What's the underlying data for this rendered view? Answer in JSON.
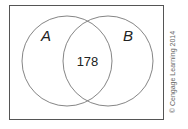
{
  "diagram": {
    "type": "venn",
    "universe_border_color": "#555555",
    "circle_color": "#777777",
    "sets": [
      {
        "id": "A",
        "label": "A"
      },
      {
        "id": "B",
        "label": "B"
      }
    ],
    "regions": {
      "A_and_B": "178"
    },
    "copyright": "© Cengage Learning 2014"
  }
}
